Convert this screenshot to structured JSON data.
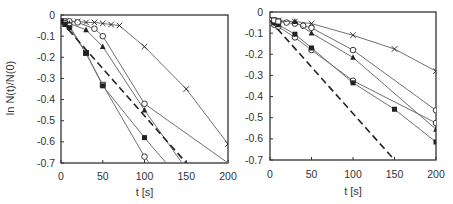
{
  "chart_data": [
    {
      "type": "line",
      "panel": "left",
      "title": "",
      "xlabel": "t [s]",
      "ylabel": "ln N(t)/N(0)",
      "xlim": [
        0,
        200
      ],
      "ylim": [
        -0.7,
        0
      ],
      "xticks": [
        0,
        50,
        100,
        150,
        200
      ],
      "yticks": [
        0,
        -0.1,
        -0.2,
        -0.3,
        -0.4,
        -0.5,
        -0.6,
        -0.7
      ],
      "xtick_labels": [
        "0",
        "50",
        "100",
        "150",
        "200"
      ],
      "ytick_labels": [
        "0",
        "-0.1",
        "-0.2",
        "-0.3",
        "-0.4",
        "-0.5",
        "-0.6",
        "-0.7"
      ],
      "grid": false,
      "legend": null,
      "series": [
        {
          "name": "cross",
          "marker": "x",
          "line": "solid",
          "x": [
            0,
            5,
            10,
            20,
            30,
            40,
            50,
            60,
            70,
            100,
            150,
            200
          ],
          "y": [
            -0.03,
            -0.03,
            -0.03,
            -0.03,
            -0.035,
            -0.035,
            -0.04,
            -0.045,
            -0.05,
            -0.15,
            -0.35,
            -0.61
          ],
          "markers_at": [
            0,
            5,
            10,
            20,
            30,
            40,
            50,
            60,
            70,
            100,
            150,
            200
          ]
        },
        {
          "name": "open-circle-a",
          "marker": "o-open",
          "line": "solid",
          "x": [
            0,
            5,
            10,
            20,
            40,
            50,
            100,
            200
          ],
          "y": [
            -0.03,
            -0.03,
            -0.03,
            -0.035,
            -0.065,
            -0.1,
            -0.42,
            -0.7
          ],
          "markers_at": [
            0,
            5,
            10,
            20,
            40,
            50,
            100
          ]
        },
        {
          "name": "filled-triangle",
          "marker": "triangle-filled",
          "line": "solid",
          "x": [
            0,
            5,
            10,
            30,
            50,
            100,
            145
          ],
          "y": [
            -0.03,
            -0.035,
            -0.04,
            -0.07,
            -0.15,
            -0.45,
            -0.7
          ],
          "markers_at": [
            0,
            5,
            10,
            30,
            50,
            100
          ]
        },
        {
          "name": "open-square",
          "marker": "square-open",
          "line": "solid",
          "x": [
            0,
            5,
            10,
            30,
            50,
            100,
            106
          ],
          "y": [
            -0.03,
            -0.04,
            -0.05,
            -0.18,
            -0.33,
            -0.67,
            -0.7
          ],
          "markers_at": [
            0,
            5,
            10,
            30,
            50
          ]
        },
        {
          "name": "open-circle-b",
          "marker": "o-open",
          "line": "none",
          "x": [
            100
          ],
          "y": [
            -0.67
          ],
          "markers_at": [
            100
          ]
        },
        {
          "name": "filled-square",
          "marker": "square-filled",
          "line": "solid",
          "x": [
            0,
            5,
            10,
            30,
            50,
            100,
            126
          ],
          "y": [
            -0.03,
            -0.045,
            -0.06,
            -0.18,
            -0.335,
            -0.58,
            -0.7
          ],
          "markers_at": [
            0,
            5,
            10,
            30,
            50,
            100
          ]
        },
        {
          "name": "reference-dashed",
          "marker": "none",
          "line": "dashed",
          "x": [
            0,
            150
          ],
          "y": [
            -0.03,
            -0.7
          ],
          "markers_at": []
        }
      ]
    },
    {
      "type": "line",
      "panel": "right",
      "title": "",
      "xlabel": "t [s]",
      "ylabel": "",
      "xlim": [
        0,
        200
      ],
      "ylim": [
        -0.7,
        0
      ],
      "xticks": [
        0,
        50,
        100,
        150,
        200
      ],
      "yticks": [
        0,
        -0.1,
        -0.2,
        -0.3,
        -0.4,
        -0.5,
        -0.6,
        -0.7
      ],
      "xtick_labels": [
        "0",
        "50",
        "100",
        "150",
        "200"
      ],
      "ytick_labels": [
        "0",
        "-0.1",
        "-0.2",
        "-0.3",
        "-0.4",
        "-0.5",
        "-0.6",
        "-0.7"
      ],
      "grid": false,
      "legend": null,
      "series": [
        {
          "name": "cross",
          "marker": "x",
          "line": "solid",
          "x": [
            0,
            5,
            10,
            30,
            50,
            100,
            150,
            200
          ],
          "y": [
            -0.04,
            -0.04,
            -0.04,
            -0.045,
            -0.055,
            -0.11,
            -0.175,
            -0.28
          ],
          "markers_at": [
            0,
            5,
            10,
            30,
            50,
            100,
            150,
            200
          ]
        },
        {
          "name": "open-circle-a",
          "marker": "o-open",
          "line": "solid",
          "x": [
            0,
            5,
            10,
            20,
            30,
            40,
            50,
            100,
            200
          ],
          "y": [
            -0.04,
            -0.04,
            -0.045,
            -0.05,
            -0.055,
            -0.065,
            -0.075,
            -0.18,
            -0.465
          ],
          "markers_at": [
            0,
            5,
            10,
            20,
            30,
            40,
            50,
            100,
            200
          ]
        },
        {
          "name": "filled-triangle",
          "marker": "triangle-filled",
          "line": "solid",
          "x": [
            0,
            5,
            10,
            30,
            50,
            100,
            200
          ],
          "y": [
            -0.04,
            -0.04,
            -0.045,
            -0.045,
            -0.1,
            -0.215,
            -0.555
          ],
          "markers_at": [
            0,
            5,
            10,
            30,
            50,
            100,
            200
          ]
        },
        {
          "name": "open-circle-b",
          "marker": "o-open",
          "line": "solid",
          "x": [
            0,
            5,
            10,
            30,
            50,
            100,
            200
          ],
          "y": [
            -0.05,
            -0.06,
            -0.07,
            -0.12,
            -0.18,
            -0.325,
            -0.525
          ],
          "markers_at": [
            0,
            5,
            10,
            30,
            50,
            100,
            200
          ]
        },
        {
          "name": "filled-square",
          "marker": "square-filled",
          "line": "solid",
          "x": [
            0,
            5,
            10,
            30,
            50,
            100,
            150,
            200
          ],
          "y": [
            -0.04,
            -0.05,
            -0.06,
            -0.105,
            -0.17,
            -0.335,
            -0.46,
            -0.615
          ],
          "markers_at": [
            0,
            5,
            10,
            30,
            50,
            100,
            150,
            200
          ]
        },
        {
          "name": "open-square",
          "marker": "square-open",
          "line": "none",
          "x": [
            0,
            5,
            10
          ],
          "y": [
            -0.04,
            -0.04,
            -0.045
          ],
          "markers_at": [
            0,
            5,
            10
          ]
        },
        {
          "name": "reference-dashed",
          "marker": "none",
          "line": "dashed",
          "x": [
            0,
            150
          ],
          "y": [
            -0.04,
            -0.7
          ],
          "markers_at": []
        }
      ]
    }
  ],
  "layout": {
    "panels": [
      {
        "left": 61,
        "right": 228,
        "top": 15,
        "bottom": 163,
        "ylabel_x": 14,
        "ylabel_y": 88,
        "ytick_label_x": 55,
        "xtick_label_y": 180,
        "xlabel_y": 196
      },
      {
        "left": 270,
        "right": 436,
        "top": 12,
        "bottom": 160,
        "ylabel_x": null,
        "ylabel_y": null,
        "ytick_label_x": 263,
        "xtick_label_y": 178,
        "xlabel_y": 195
      }
    ],
    "colors": {
      "axis": "#333333",
      "line": "#707070",
      "marker": "#222222",
      "dashed": "#222222",
      "text": "#333333"
    }
  }
}
